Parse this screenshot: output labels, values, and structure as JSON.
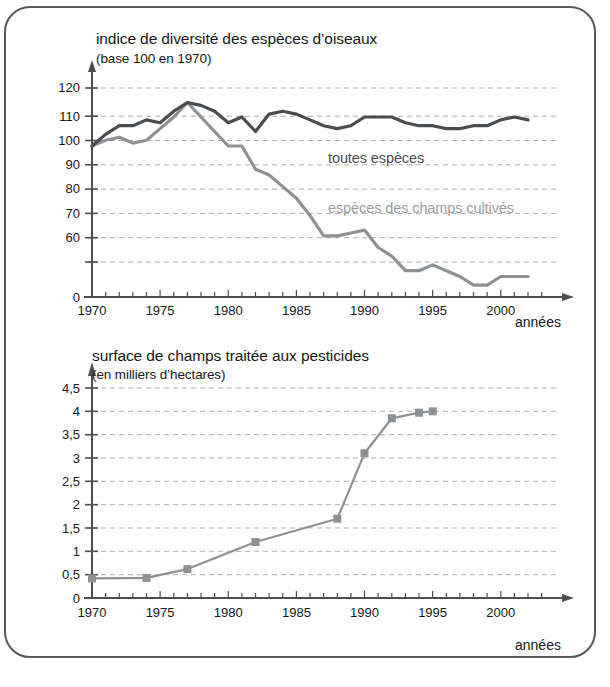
{
  "page": {
    "frame": {
      "border_color": "#555a5c"
    },
    "background": "#ffffff"
  },
  "chart_top": {
    "title": "indice de diversité des espèces d’oiseaux",
    "subtitle": "(base 100 en 1970)",
    "xaxis_name": "années",
    "ytick_labels": [
      "0",
      "60",
      "70",
      "80",
      "90",
      "100",
      "110",
      "120"
    ],
    "xtick_labels": [
      "1970",
      "1975",
      "1980",
      "1985",
      "1990",
      "1995",
      "2000"
    ],
    "series_label_all": "toutes espèces",
    "series_label_fields": "espèces des champs cultivés",
    "color_all": "#4a4d50",
    "color_fields": "#8e9194"
  },
  "chart_bottom": {
    "title": "surface de champs traitée aux pesticides",
    "subtitle": "(en milliers d’hectares)",
    "xaxis_name": "années",
    "ytick_labels": [
      "0",
      "0,5",
      "1",
      "1,5",
      "2",
      "2,5",
      "3",
      "3,5",
      "4",
      "4,5"
    ],
    "xtick_labels": [
      "1970",
      "1975",
      "1980",
      "1985",
      "1990",
      "1995",
      "2000"
    ],
    "color_line": "#8e9194"
  },
  "chart_data": [
    {
      "id": "bird-diversity-index",
      "type": "line",
      "title": "indice de diversité des espèces d’oiseaux",
      "subtitle": "(base 100 en 1970)",
      "xlabel": "années",
      "ylabel": "indice (base 100 en 1970)",
      "xlim": [
        1970,
        2002
      ],
      "ylim": [
        55,
        122
      ],
      "yticks": [
        60,
        70,
        80,
        90,
        100,
        110,
        120
      ],
      "xticks": [
        1970,
        1975,
        1980,
        1985,
        1990,
        1995,
        2000
      ],
      "grid": true,
      "y_axis_break": true,
      "legend": "inline-annotations",
      "x": [
        1970,
        1971,
        1972,
        1973,
        1974,
        1975,
        1976,
        1977,
        1978,
        1979,
        1980,
        1981,
        1982,
        1983,
        1984,
        1985,
        1986,
        1987,
        1988,
        1989,
        1990,
        1991,
        1992,
        1993,
        1994,
        1995,
        1996,
        1997,
        1998,
        1999,
        2000,
        2001,
        2002
      ],
      "series": [
        {
          "name": "toutes espèces",
          "color": "#4a4d50",
          "values": [
            100,
            104,
            107,
            107,
            109,
            108,
            112,
            115,
            114,
            112,
            108,
            110,
            105,
            111,
            112,
            111,
            109,
            107,
            106,
            107,
            110,
            110,
            110,
            108,
            107,
            107,
            106,
            106,
            107,
            107,
            109,
            110,
            109
          ]
        },
        {
          "name": "espèces des champs cultivés",
          "color": "#8e9194",
          "values": [
            100,
            102,
            103,
            101,
            102,
            106,
            110,
            115,
            110,
            105,
            100,
            100,
            92,
            90,
            86,
            82,
            76,
            69,
            69,
            70,
            71,
            65,
            62,
            57,
            57,
            59,
            57,
            55,
            52,
            52,
            55,
            55,
            55
          ]
        }
      ]
    },
    {
      "id": "pesticide-treated-area",
      "type": "line",
      "title": "surface de champs traitée aux pesticides",
      "subtitle": "(en milliers d’hectares)",
      "xlabel": "années",
      "ylabel": "surface (milliers d’hectares)",
      "xlim": [
        1970,
        2002
      ],
      "ylim": [
        0,
        4.5
      ],
      "yticks": [
        0,
        0.5,
        1,
        1.5,
        2,
        2.5,
        3,
        3.5,
        4,
        4.5
      ],
      "xticks": [
        1970,
        1975,
        1980,
        1985,
        1990,
        1995,
        2000
      ],
      "grid": true,
      "markers": "square",
      "color": "#8e9194",
      "x": [
        1970,
        1974,
        1977,
        1982,
        1988,
        1990,
        1992,
        1994,
        1995
      ],
      "values": [
        0.42,
        0.43,
        0.62,
        1.2,
        1.7,
        3.1,
        3.85,
        3.97,
        4.0
      ]
    }
  ]
}
